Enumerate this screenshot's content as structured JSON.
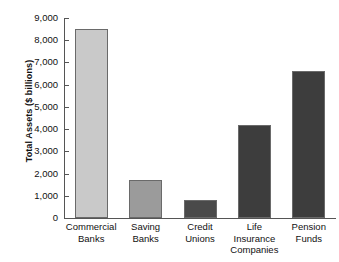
{
  "chart_data": {
    "type": "bar",
    "title": "",
    "xlabel": "",
    "ylabel": "Total Assets ($ billions)",
    "ylim": [
      0,
      9000
    ],
    "grid": false,
    "legend": "none",
    "categories": [
      "Commercial Banks",
      "Saving Banks",
      "Credit Unions",
      "Life Insurance Companies",
      "Pension Funds"
    ],
    "category_lines": [
      [
        "Commercial",
        "Banks"
      ],
      [
        "Saving",
        "Banks"
      ],
      [
        "Credit",
        "Unions"
      ],
      [
        "Life",
        "Insurance",
        "Companies"
      ],
      [
        "Pension",
        "Funds"
      ]
    ],
    "values": [
      8500,
      1700,
      800,
      4200,
      6600
    ],
    "bar_colors": [
      "#c9c9c9",
      "#9b9b9b",
      "#4a4a4a",
      "#3d3d3d",
      "#3d3d3d"
    ],
    "yticks": [
      0,
      1000,
      2000,
      3000,
      4000,
      5000,
      6000,
      7000,
      8000,
      9000
    ],
    "ytick_labels": [
      "0",
      "1,000",
      "2,000",
      "3,000",
      "4,000",
      "5,000",
      "6,000",
      "7,000",
      "8,000",
      "9,000"
    ]
  },
  "axis": {
    "line_color": "#555555",
    "text_color": "#111111"
  }
}
